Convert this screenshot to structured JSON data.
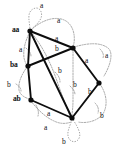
{
  "figure": {
    "kind": "state-transition-diagram",
    "background_color": "#ffffff",
    "solid_edge_color": "#0d0d0d",
    "dotted_edge_color": "#8e8e8e",
    "node_color": "#0d0d0d",
    "width": 118,
    "height": 148
  },
  "nodes": [
    {
      "id": "aa",
      "label": "aa",
      "x": 30,
      "y": 31,
      "label_x": 12,
      "label_y": 26
    },
    {
      "id": "top",
      "label": "",
      "x": 73,
      "y": 48,
      "label_x": 0,
      "label_y": 0
    },
    {
      "id": "ba",
      "label": "ba",
      "x": 28,
      "y": 66,
      "label_x": 10,
      "label_y": 61
    },
    {
      "id": "right",
      "label": "",
      "x": 99,
      "y": 83,
      "label_x": 0,
      "label_y": 0
    },
    {
      "id": "ab",
      "label": "ab",
      "x": 31,
      "y": 100,
      "label_x": 13,
      "label_y": 95
    },
    {
      "id": "bottom",
      "label": "",
      "x": 72,
      "y": 118,
      "label_x": 0,
      "label_y": 0
    }
  ],
  "edge_labels": [
    {
      "id": "loop-aa-a",
      "text": "a",
      "x": 40,
      "y": 2,
      "style": "dotted",
      "describes": "self loop on aa"
    },
    {
      "id": "curve-top-a",
      "text": "a",
      "x": 57,
      "y": 17,
      "style": "dotted",
      "describes": "curved arc into top node"
    },
    {
      "id": "aa-top-a",
      "text": "a",
      "x": 55,
      "y": 35,
      "style": "solid",
      "describes": "aa to top node"
    },
    {
      "id": "top-b",
      "text": "b",
      "x": 55,
      "y": 45,
      "style": "solid",
      "describes": "label below top node"
    },
    {
      "id": "aa-ba-a",
      "text": "a",
      "x": 19,
      "y": 46,
      "style": "dotted",
      "describes": "aa down to ba"
    },
    {
      "id": "top-right-a",
      "text": "a",
      "x": 85,
      "y": 57,
      "style": "solid",
      "describes": "top node to right node"
    },
    {
      "id": "right-arc-a",
      "text": "a",
      "x": 105,
      "y": 52,
      "style": "dotted",
      "describes": "outer right arc"
    },
    {
      "id": "mid-b-left",
      "text": "b",
      "x": 58,
      "y": 67,
      "style": "dotted",
      "describes": "middle left b"
    },
    {
      "id": "mid-b-right",
      "text": "b",
      "x": 73,
      "y": 81,
      "style": "dotted",
      "describes": "middle right b"
    },
    {
      "id": "ba-ab-b",
      "text": "b",
      "x": 7,
      "y": 81,
      "style": "dotted",
      "describes": "ba down to ab"
    },
    {
      "id": "right-bottom-b",
      "text": "b",
      "x": 88,
      "y": 88,
      "style": "solid",
      "describes": "right node to bottom node"
    },
    {
      "id": "right-arc-b",
      "text": "b",
      "x": 100,
      "y": 112,
      "style": "dotted",
      "describes": "outer right lower arc"
    },
    {
      "id": "ab-bottom-a1",
      "text": "a",
      "x": 47,
      "y": 110,
      "style": "solid",
      "describes": "ab to bottom node"
    },
    {
      "id": "ab-bottom-a2",
      "text": "a",
      "x": 44,
      "y": 124,
      "style": "dotted",
      "describes": "lower arc under ab"
    },
    {
      "id": "loop-bottom-b",
      "text": "b",
      "x": 62,
      "y": 138,
      "style": "dotted",
      "describes": "self loop on bottom node"
    }
  ],
  "solid_edges": [
    {
      "from": "aa",
      "to": "top",
      "label": "a"
    },
    {
      "from": "aa",
      "to": "ba",
      "label": "a"
    },
    {
      "from": "ba",
      "to": "top",
      "label": "b"
    },
    {
      "from": "top",
      "to": "right",
      "label": "a"
    },
    {
      "from": "right",
      "to": "bottom",
      "label": "b"
    },
    {
      "from": "ab",
      "to": "bottom",
      "label": "a"
    },
    {
      "from": "aa",
      "to": "bottom",
      "label": "b"
    },
    {
      "from": "ba",
      "to": "ab",
      "label": "b"
    }
  ],
  "dotted_edges": [
    {
      "from": "aa",
      "to": "aa",
      "label": "a",
      "type": "self-loop"
    },
    {
      "from": "bottom",
      "to": "bottom",
      "label": "b",
      "type": "self-loop"
    },
    {
      "from": "aa",
      "to": "top",
      "label": "a",
      "type": "arc"
    },
    {
      "from": "top",
      "to": "right",
      "label": "a",
      "type": "arc"
    },
    {
      "from": "right",
      "to": "bottom",
      "label": "b",
      "type": "arc"
    },
    {
      "from": "ba",
      "to": "ab",
      "label": "b",
      "type": "arc"
    },
    {
      "from": "ab",
      "to": "bottom",
      "label": "a",
      "type": "arc"
    },
    {
      "from": "top",
      "to": "bottom",
      "label": "b",
      "type": "arc"
    },
    {
      "from": "aa",
      "to": "bottom",
      "label": "b",
      "type": "arc"
    }
  ]
}
